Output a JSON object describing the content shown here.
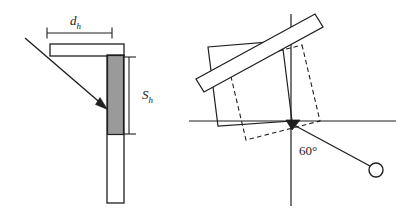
{
  "figure": {
    "panels": [
      {
        "id": "left-panel",
        "name": "heliostat-cross-section",
        "labels": {
          "width_symbol": "d",
          "width_subscript": "h",
          "height_symbol": "S",
          "height_subscript": "h"
        },
        "elements": [
          "width-dimension-line",
          "height-dimension-line",
          "horizontal-bar",
          "vertical-bar",
          "shaded-segment",
          "incident-ray-arrow"
        ]
      },
      {
        "id": "right-panel",
        "name": "rotated-heliostat-orientation",
        "labels": {
          "angle_value": "60",
          "angle_unit": "°",
          "angle_label": "60°"
        },
        "elements": [
          "horizontal-axis",
          "vertical-axis",
          "solid-rotated-square",
          "dashed-rotated-square",
          "tilted-mirror-bar",
          "pivot-marker",
          "ray-line",
          "target-circle"
        ]
      }
    ],
    "colors": {
      "line": "#1f1f1f",
      "shaded_fill": "#9a9a9a",
      "background": "#ffffff",
      "text": "#1a1a1a"
    }
  }
}
